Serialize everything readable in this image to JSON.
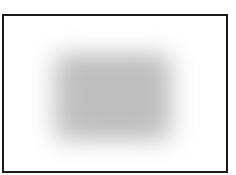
{
  "frame": {
    "border_color": "#1a1a1a",
    "background": "#ffffff"
  },
  "content": {
    "type": "blurred-image-placeholder",
    "fill_color": "#c4c4c4"
  }
}
